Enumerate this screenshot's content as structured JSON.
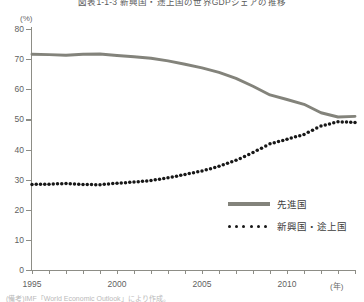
{
  "header": {
    "title": "図表1-1-3 新興国・途上国の世界GDPシェアの推移",
    "source_note": "(備考)IMF「World Economic Outlook」により作成。"
  },
  "axes": {
    "y_unit_label": "(%)",
    "x_unit_label": "(年)",
    "y_ticks": [
      "80",
      "70",
      "60",
      "50",
      "40",
      "30",
      "20",
      "10",
      "0"
    ],
    "x_ticks": [
      "1995",
      "2000",
      "2005",
      "2010"
    ]
  },
  "legend": {
    "items": [
      {
        "label": "先進国",
        "style": "solid",
        "color": "#83837b"
      },
      {
        "label": "新興国・途上国",
        "style": "dotted",
        "color": "#171717"
      }
    ]
  },
  "chart_data": {
    "type": "line",
    "title": "図表1-1-3 新興国・途上国の世界GDPシェアの推移",
    "xlabel": "(年)",
    "ylabel": "(%)",
    "xlim": [
      1995,
      2014
    ],
    "ylim": [
      0,
      80
    ],
    "ytick_interval": 10,
    "grid": false,
    "legend_position": "lower-right",
    "x": [
      1995,
      1996,
      1997,
      1998,
      1999,
      2000,
      2001,
      2002,
      2003,
      2004,
      2005,
      2006,
      2007,
      2008,
      2009,
      2010,
      2011,
      2012,
      2013,
      2014
    ],
    "series": [
      {
        "name": "先進国",
        "style": "solid",
        "color": "#83837b",
        "values": [
          71.6,
          71.5,
          71.3,
          71.6,
          71.7,
          71.2,
          70.8,
          70.3,
          69.4,
          68.3,
          67.1,
          65.6,
          63.6,
          61.0,
          58.1,
          56.6,
          55.0,
          52.2,
          50.8,
          51.0
        ]
      },
      {
        "name": "新興国・途上国",
        "style": "dotted",
        "color": "#171717",
        "values": [
          28.4,
          28.5,
          28.7,
          28.4,
          28.3,
          28.8,
          29.2,
          29.7,
          30.6,
          31.7,
          32.9,
          34.4,
          36.4,
          39.0,
          41.9,
          43.4,
          45.0,
          47.8,
          49.2,
          49.0
        ]
      }
    ]
  }
}
